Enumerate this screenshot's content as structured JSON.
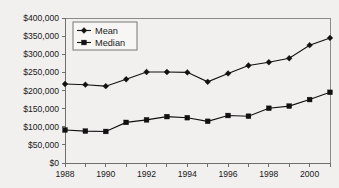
{
  "chart_data": {
    "type": "line",
    "title": "",
    "xlabel": "",
    "ylabel": "",
    "x": [
      1988,
      1989,
      1990,
      1991,
      1992,
      1993,
      1994,
      1995,
      1996,
      1997,
      1998,
      1999,
      2000,
      2001
    ],
    "categories": [
      "1988",
      "1989",
      "1990",
      "1991",
      "1992",
      "1993",
      "1994",
      "1995",
      "1996",
      "1997",
      "1998",
      "1999",
      "2000",
      "2001"
    ],
    "series": [
      {
        "name": "Mean",
        "marker": "diamond",
        "values": [
          218000,
          216000,
          212000,
          231000,
          251000,
          251000,
          250000,
          224000,
          247000,
          269000,
          278000,
          289000,
          325000,
          345000
        ]
      },
      {
        "name": "Median",
        "marker": "square",
        "values": [
          91000,
          88000,
          87000,
          112000,
          119000,
          128000,
          125000,
          115000,
          131000,
          129000,
          151000,
          157000,
          175000,
          195000
        ]
      }
    ],
    "xlim": [
      1988,
      2001
    ],
    "ylim": [
      0,
      400000
    ],
    "ytick_values": [
      0,
      50000,
      100000,
      150000,
      200000,
      250000,
      300000,
      350000,
      400000
    ],
    "ytick_labels": [
      "$0",
      "$50,000",
      "$100,000",
      "$150,000",
      "$200,000",
      "$250,000",
      "$300,000",
      "$350,000",
      "$400,000"
    ],
    "xtick_values": [
      1988,
      1990,
      1992,
      1994,
      1996,
      1998,
      2000
    ],
    "xtick_labels": [
      "1988",
      "1990",
      "1992",
      "1994",
      "1996",
      "1998",
      "2000"
    ],
    "xminor_values": [
      1989,
      1991,
      1993,
      1995,
      1997,
      1999,
      2001
    ],
    "grid": false,
    "legend": {
      "position": "top-left-inside",
      "entries": [
        "Mean",
        "Median"
      ]
    },
    "colors": {
      "series": "#111111",
      "axis": "#6f6f6f",
      "frame": "#8a8a8a",
      "background": "#f1f0ee",
      "text": "#1a1a1a",
      "legend_background": "#f7f6f4"
    }
  }
}
